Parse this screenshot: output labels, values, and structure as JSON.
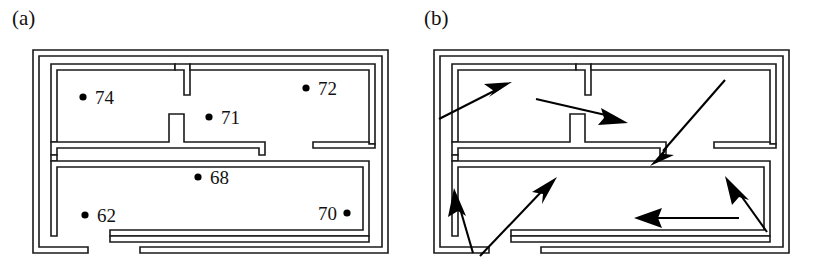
{
  "figure": {
    "type": "diagram",
    "background_color": "#ffffff",
    "line_color": "#1a1a1a",
    "panel_count": 2
  },
  "panels": [
    {
      "id": "a",
      "label": "(a)",
      "name": "floor-plan-with-sensor-readings",
      "sensors": [
        {
          "id": "s74",
          "label": "74",
          "dot_side": "left",
          "x": 83,
          "y": 97,
          "text_x": 95,
          "text_y": 104
        },
        {
          "id": "s72",
          "label": "72",
          "dot_side": "left",
          "x": 306,
          "y": 88,
          "text_x": 318,
          "text_y": 95
        },
        {
          "id": "s71",
          "label": "71",
          "dot_side": "left",
          "x": 209,
          "y": 117,
          "text_x": 221,
          "text_y": 124
        },
        {
          "id": "s68",
          "label": "68",
          "dot_side": "left",
          "x": 198,
          "y": 177,
          "text_x": 210,
          "text_y": 184
        },
        {
          "id": "s62",
          "label": "62",
          "dot_side": "left",
          "x": 85,
          "y": 215,
          "text_x": 97,
          "text_y": 222
        },
        {
          "id": "s70",
          "label": "70",
          "dot_side": "right",
          "x": 347,
          "y": 213,
          "text_x": 318,
          "text_y": 220
        }
      ]
    },
    {
      "id": "b",
      "label": "(b)",
      "name": "floor-plan-with-flow-arrows",
      "arrows": [
        {
          "id": "arrow-upper-left-outbound",
          "direction": "up-right",
          "x1": 27,
          "y1": 119,
          "x2": 96,
          "y2": 83
        },
        {
          "id": "arrow-upper-mid-to-right",
          "direction": "down-right",
          "x1": 124,
          "y1": 99,
          "x2": 210,
          "y2": 120
        },
        {
          "id": "arrow-long-diagonal-inward",
          "direction": "down-left",
          "x1": 310,
          "y1": 82,
          "x2": 240,
          "y2": 162
        },
        {
          "id": "arrow-lower-left-up",
          "direction": "up-left",
          "x1": 61,
          "y1": 253,
          "x2": 43,
          "y2": 193
        },
        {
          "id": "arrow-lower-mid-up-right",
          "direction": "up-right",
          "x1": 68,
          "y1": 256,
          "x2": 142,
          "y2": 180
        },
        {
          "id": "arrow-lower-right-up-left",
          "direction": "up-left",
          "x1": 355,
          "y1": 232,
          "x2": 316,
          "y2": 179
        },
        {
          "id": "arrow-horizontal-left",
          "direction": "left",
          "x1": 327,
          "y1": 218,
          "x2": 225,
          "y2": 218
        }
      ]
    }
  ],
  "walls": {
    "description": "shared floor-plan geometry used by both panels",
    "outer_boundary": {
      "x": 33,
      "y": 50,
      "width": 355,
      "height": 203,
      "thickness": 6
    },
    "segments": [
      {
        "name": "outer-wall",
        "kind": "boundary"
      },
      {
        "name": "horizontal-divider-wall",
        "kind": "interior"
      },
      {
        "name": "vertical-t-wall-upper",
        "kind": "interior"
      },
      {
        "name": "vertical-t-wall-lower",
        "kind": "interior"
      },
      {
        "name": "bottom-wall-gap",
        "kind": "doorway"
      },
      {
        "name": "right-divider-gap",
        "kind": "doorway"
      },
      {
        "name": "bottom-left-gap",
        "kind": "doorway"
      }
    ]
  }
}
